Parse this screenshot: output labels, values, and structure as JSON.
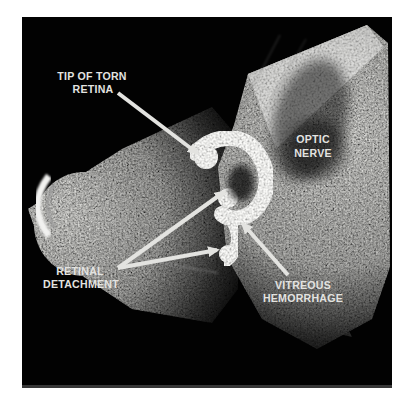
{
  "figure": {
    "colors": {
      "page_background": "#ffffff",
      "scan_background": "#000000",
      "annotation": "#e3e3e0",
      "bright_echo": "#f2f2f0"
    },
    "labels": {
      "tip_of_torn_retina": {
        "lines": [
          "TIP OF TORN",
          "RETINA"
        ]
      },
      "optic_nerve": {
        "lines": [
          "OPTIC",
          "NERVE"
        ]
      },
      "retinal_detachment": {
        "lines": [
          "RETINAL",
          "DETACHMENT"
        ]
      },
      "vitreous_hemorrhage": {
        "lines": [
          "VITREOUS",
          "HEMORRHAGE"
        ]
      }
    }
  }
}
